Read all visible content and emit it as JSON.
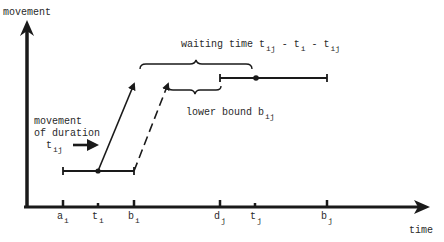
{
  "diagram": {
    "y_axis_label": "movement",
    "x_axis_label": "time",
    "ticks": [
      {
        "base": "a",
        "sub": "i",
        "x": 63
      },
      {
        "base": "t",
        "sub": "i",
        "x": 98
      },
      {
        "base": "b",
        "sub": "i",
        "x": 134
      },
      {
        "base": "d",
        "sub": "j",
        "x": 220
      },
      {
        "base": "t",
        "sub": "j",
        "x": 255
      },
      {
        "base": "b",
        "sub": "j",
        "x": 327
      }
    ],
    "waiting_time": {
      "prefix": "waiting time ",
      "t1": "t",
      "t1_sub": "ij",
      "sep1": " - ",
      "t2": "t",
      "t2_sub": "i",
      "sep2": " - ",
      "t3": "t",
      "t3_sub": "ij"
    },
    "lower_bound": {
      "prefix": "lower bound ",
      "b": "b",
      "b_sub": "ij"
    },
    "movement_note": {
      "line1": "movement",
      "line2": "of duration",
      "t": "t",
      "t_sub": "ij"
    },
    "colors": {
      "ink": "#1a1a1a",
      "background": "#ffffff"
    }
  }
}
